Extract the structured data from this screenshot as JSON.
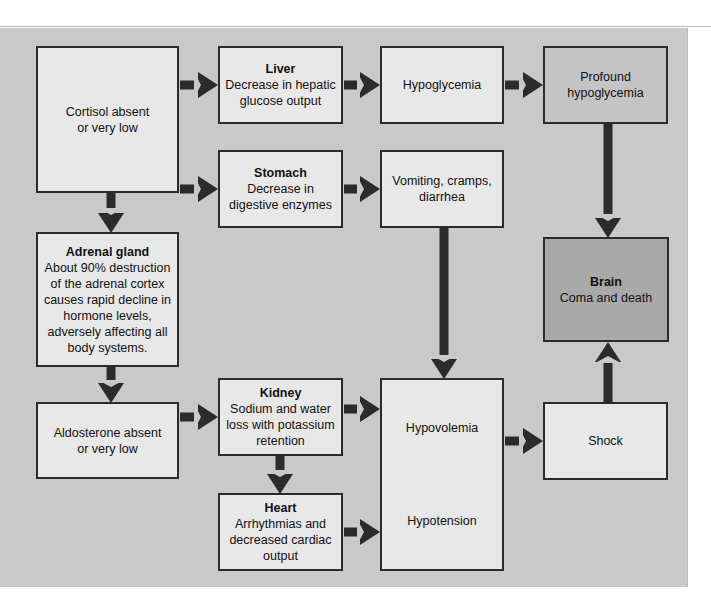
{
  "figure": {
    "type": "flowchart",
    "background_color": "#c9c9c9",
    "node_fill_color": "#e8e8e8",
    "shaded_node_color": "#c4c4c4",
    "dark_node_color": "#a9a9a9",
    "stroke_color": "#2b2b2b"
  },
  "nodes": {
    "cortisol": {
      "title": "",
      "body": "Cortisol absent\nor very low"
    },
    "liver": {
      "title": "Liver",
      "body": "Decrease in hepatic\nglucose output"
    },
    "hypoglycemia": {
      "title": "",
      "body": "Hypoglycemia"
    },
    "profound_hypoglycemia": {
      "title": "",
      "body": "Profound\nhypoglycemia"
    },
    "stomach": {
      "title": "Stomach",
      "body": "Decrease in\ndigestive enzymes"
    },
    "vomiting": {
      "title": "",
      "body": "Vomiting, cramps,\ndiarrhea"
    },
    "brain": {
      "title": "Brain",
      "body": "Coma and death"
    },
    "adrenal_gland": {
      "title": "Adrenal gland",
      "body": "About 90% destruction\nof the adrenal cortex\ncauses rapid decline in\nhormone levels,\nadversely affecting all\nbody systems."
    },
    "aldosterone": {
      "title": "",
      "body": "Aldosterone absent\nor very low"
    },
    "kidney": {
      "title": "Kidney",
      "body": "Sodium and water\nloss with potassium\nretention"
    },
    "heart": {
      "title": "Heart",
      "body": "Arrhythmias and\ndecreased cardiac\noutput"
    },
    "hypovolemia_hypotension": {
      "top": "Hypovolemia",
      "bottom": "Hypotension"
    },
    "shock": {
      "title": "",
      "body": "Shock"
    }
  },
  "edges": [
    {
      "from": "cortisol",
      "to": "liver",
      "direction": "right"
    },
    {
      "from": "cortisol",
      "to": "stomach",
      "direction": "right"
    },
    {
      "from": "cortisol",
      "to": "adrenal_gland",
      "direction": "down"
    },
    {
      "from": "liver",
      "to": "hypoglycemia",
      "direction": "right"
    },
    {
      "from": "hypoglycemia",
      "to": "profound_hypoglycemia",
      "direction": "right"
    },
    {
      "from": "profound_hypoglycemia",
      "to": "brain",
      "direction": "down"
    },
    {
      "from": "stomach",
      "to": "vomiting",
      "direction": "right"
    },
    {
      "from": "vomiting",
      "to": "hypovolemia_hypotension",
      "direction": "down"
    },
    {
      "from": "adrenal_gland",
      "to": "aldosterone",
      "direction": "down"
    },
    {
      "from": "aldosterone",
      "to": "kidney",
      "direction": "right"
    },
    {
      "from": "kidney",
      "to": "hypovolemia_hypotension",
      "direction": "right"
    },
    {
      "from": "kidney",
      "to": "heart",
      "direction": "down"
    },
    {
      "from": "heart",
      "to": "hypovolemia_hypotension",
      "direction": "right"
    },
    {
      "from": "hypovolemia_hypotension",
      "to": "shock",
      "direction": "right"
    },
    {
      "from": "shock",
      "to": "brain",
      "direction": "up"
    }
  ]
}
